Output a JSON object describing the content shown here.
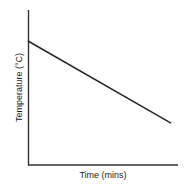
{
  "chart_data": {
    "type": "line",
    "title": "",
    "subtitle": "",
    "xlabel": "Time (mins)",
    "ylabel": "Temperature (°C)",
    "grid": false,
    "legend": false,
    "legend_position": "none",
    "x_tick_labels": [],
    "y_tick_labels": [],
    "xlim": [
      0,
      100
    ],
    "ylim": [
      0,
      100
    ],
    "axis_color": "#333333",
    "line_color": "#262626",
    "background_color": "#ffffff",
    "series": [
      {
        "name": "Cooling curve",
        "color": "#262626",
        "x": [
          0,
          100
        ],
        "values": [
          80,
          27
        ]
      }
    ],
    "annotations": []
  },
  "figure": {
    "y_axis_label": "Temperature (°C)",
    "x_axis_label": "Time (mins)"
  }
}
